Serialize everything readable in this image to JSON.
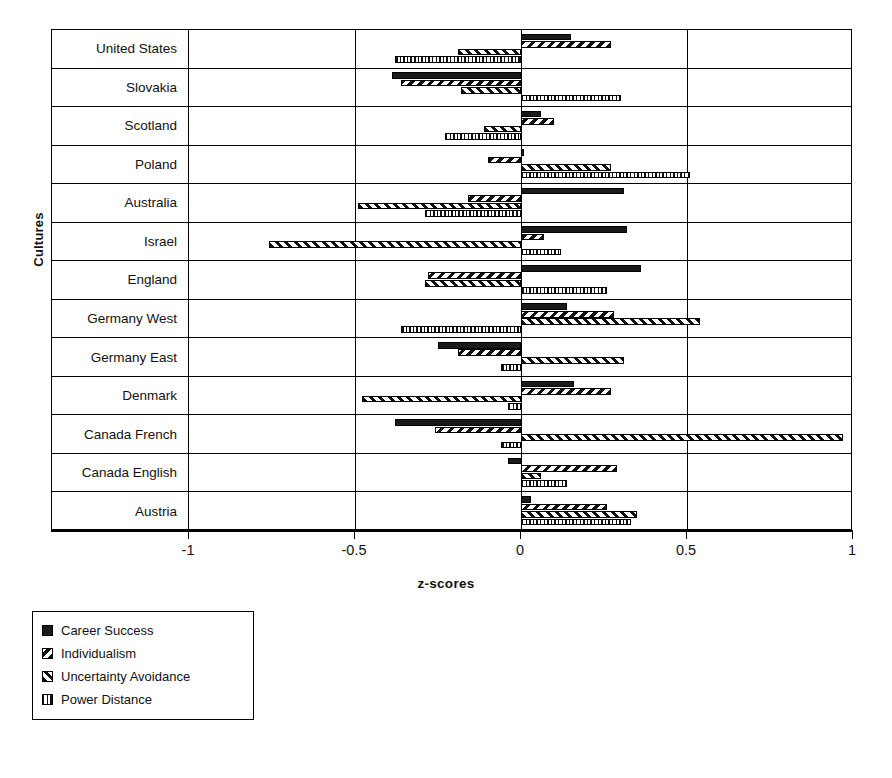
{
  "chart_data": {
    "type": "bar",
    "orientation": "horizontal",
    "title": "",
    "xlabel": "z-scores",
    "ylabel": "Cultures",
    "xlim": [
      -1,
      1
    ],
    "xticks": [
      -1,
      -0.5,
      0,
      0.5,
      1
    ],
    "xticklabels": [
      "-1",
      "-0.5",
      "0",
      "0.5",
      "1"
    ],
    "grid": true,
    "legend_position": "below-left",
    "categories": [
      "United States",
      "Slovakia",
      "Scotland",
      "Poland",
      "Australia",
      "Israel",
      "England",
      "Germany West",
      "Germany East",
      "Denmark",
      "Canada French",
      "Canada English",
      "Austria"
    ],
    "series": [
      {
        "name": "Career Success",
        "pattern": "solid",
        "values": [
          0.15,
          -0.39,
          0.06,
          0.01,
          0.31,
          0.32,
          0.36,
          0.14,
          -0.25,
          0.16,
          -0.38,
          -0.04,
          0.03
        ]
      },
      {
        "name": "Individualism",
        "pattern": "backslash-hatch",
        "values": [
          0.27,
          -0.36,
          0.1,
          -0.1,
          -0.16,
          0.07,
          -0.28,
          0.28,
          -0.19,
          0.27,
          -0.26,
          0.29,
          0.26
        ]
      },
      {
        "name": "Uncertainty Avoidance",
        "pattern": "forwardslash-hatch",
        "values": [
          -0.19,
          -0.18,
          -0.11,
          0.27,
          -0.49,
          -0.76,
          -0.29,
          0.54,
          0.31,
          -0.48,
          0.97,
          0.06,
          0.35
        ]
      },
      {
        "name": "Power Distance",
        "pattern": "vertical-lines",
        "values": [
          -0.38,
          0.3,
          -0.23,
          0.51,
          -0.29,
          0.12,
          0.26,
          -0.36,
          -0.06,
          -0.04,
          -0.06,
          0.14,
          0.33
        ]
      }
    ]
  },
  "legend": {
    "items": [
      {
        "label": "Career Success"
      },
      {
        "label": "Individualism"
      },
      {
        "label": "Uncertainty Avoidance"
      },
      {
        "label": "Power Distance"
      }
    ]
  }
}
